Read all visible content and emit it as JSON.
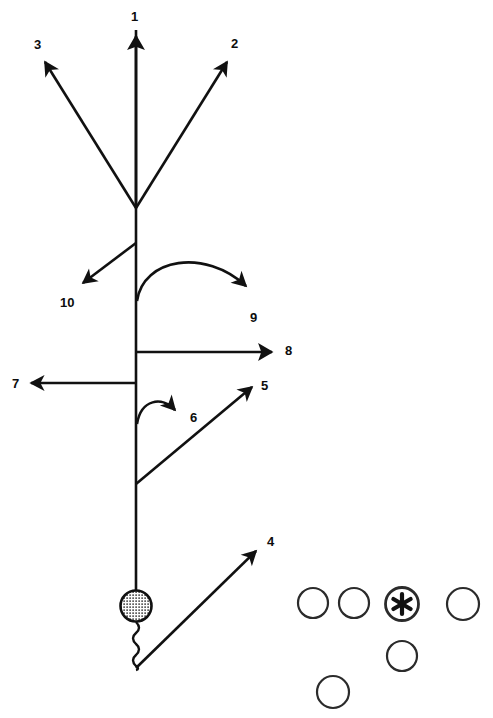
{
  "diagram": {
    "canvas": {
      "width": 493,
      "height": 718,
      "background": "#ffffff"
    },
    "stroke_color": "#111111",
    "labels": [
      {
        "id": "label-1",
        "text": "1",
        "x": 131,
        "y": 10,
        "for_arrow": 1
      },
      {
        "id": "label-2",
        "text": "2",
        "x": 231,
        "y": 37,
        "for_arrow": 2
      },
      {
        "id": "label-3",
        "text": "3",
        "x": 34,
        "y": 38,
        "for_arrow": 3
      },
      {
        "id": "label-4",
        "text": "4",
        "x": 267,
        "y": 535,
        "for_arrow": 4
      },
      {
        "id": "label-5",
        "text": "5",
        "x": 261,
        "y": 379,
        "for_arrow": 5
      },
      {
        "id": "label-6",
        "text": "6",
        "x": 190,
        "y": 411,
        "for_arrow": 6
      },
      {
        "id": "label-7",
        "text": "7",
        "x": 12,
        "y": 377,
        "for_arrow": 7
      },
      {
        "id": "label-8",
        "text": "8",
        "x": 285,
        "y": 344,
        "for_arrow": 8
      },
      {
        "id": "label-9",
        "text": "9",
        "x": 250,
        "y": 311,
        "for_arrow": 9
      },
      {
        "id": "label-10",
        "text": "10",
        "x": 60,
        "y": 296,
        "for_arrow": 10
      }
    ],
    "arrows": [
      {
        "id": "arrow-1",
        "number": "1",
        "kind": "straight",
        "from": [
          136,
          208
        ],
        "to": [
          136,
          30
        ],
        "head": "large-wide"
      },
      {
        "id": "arrow-2",
        "number": "2",
        "kind": "straight",
        "from": [
          136,
          208
        ],
        "to": [
          231,
          58
        ],
        "head": "normal"
      },
      {
        "id": "arrow-3",
        "number": "3",
        "kind": "straight",
        "from": [
          136,
          208
        ],
        "to": [
          41,
          58
        ],
        "head": "normal"
      },
      {
        "id": "arrow-4",
        "number": "4",
        "kind": "straight",
        "from": [
          136,
          668
        ],
        "to": [
          262,
          546
        ],
        "head": "normal"
      },
      {
        "id": "arrow-5",
        "number": "5",
        "kind": "straight",
        "from": [
          136,
          484
        ],
        "to": [
          258,
          382
        ],
        "head": "normal"
      },
      {
        "id": "arrow-6",
        "number": "6",
        "kind": "curved",
        "from": [
          136,
          424
        ],
        "to": [
          181,
          413
        ],
        "head": "normal"
      },
      {
        "id": "arrow-7",
        "number": "7",
        "kind": "straight",
        "from": [
          136,
          383
        ],
        "to": [
          25,
          383
        ],
        "head": "normal"
      },
      {
        "id": "arrow-8",
        "number": "8",
        "kind": "straight",
        "from": [
          136,
          352
        ],
        "to": [
          281,
          352
        ],
        "head": "large-wide"
      },
      {
        "id": "arrow-9",
        "number": "9",
        "kind": "curved",
        "from": [
          136,
          300
        ],
        "to": [
          254,
          297
        ],
        "head": "normal"
      },
      {
        "id": "arrow-10",
        "number": "10",
        "kind": "straight",
        "from": [
          136,
          243
        ],
        "to": [
          79,
          287
        ],
        "head": "normal"
      }
    ],
    "stem": {
      "id": "main-stem",
      "from": [
        136,
        30
      ],
      "to": [
        136,
        591
      ]
    },
    "ball": {
      "id": "hatched-ball",
      "cx": 136,
      "cy": 606,
      "r": 16,
      "fill": "cross-hatch"
    },
    "squiggle": {
      "id": "squiggle-tail",
      "from": [
        136,
        622
      ],
      "to": [
        136,
        668
      ],
      "waves": 5
    },
    "circles": [
      {
        "id": "circle-marker-1",
        "cx": 313,
        "cy": 603,
        "r": 15,
        "marked": false
      },
      {
        "id": "circle-marker-2",
        "cx": 354,
        "cy": 603,
        "r": 15,
        "marked": false
      },
      {
        "id": "circle-marker-3",
        "cx": 402,
        "cy": 604,
        "r": 17,
        "marked": true,
        "glyph": "asterisk"
      },
      {
        "id": "circle-marker-4",
        "cx": 463,
        "cy": 604,
        "r": 16,
        "marked": false
      },
      {
        "id": "circle-marker-5",
        "cx": 402,
        "cy": 656,
        "r": 15,
        "marked": false
      },
      {
        "id": "circle-marker-6",
        "cx": 333,
        "cy": 692,
        "r": 16,
        "marked": false
      }
    ]
  }
}
